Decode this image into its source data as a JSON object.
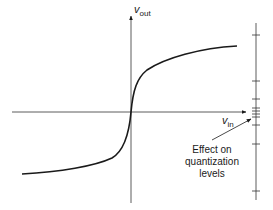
{
  "diagram": {
    "y_axis": {
      "symbol": "v",
      "subscript": "out"
    },
    "x_axis": {
      "symbol": "v",
      "subscript": "in"
    },
    "annotation": {
      "lines": [
        "Effect on",
        "quantization",
        "levels"
      ]
    },
    "curve": {
      "type": "compressor (odd-symmetric, steep slope near origin, saturating)",
      "path": "M22,174 C60,172 95,166 112,158 C124,151 129,135 131,112 C133,90 137,78 147,70 C165,58 200,48 237,46"
    },
    "quantization_scale": {
      "x": 256,
      "y_top": 23,
      "y_bottom": 200,
      "tick_y": [
        35,
        81,
        99,
        108,
        111,
        114,
        117,
        125,
        144,
        191
      ]
    },
    "colors": {
      "line": "#1a1a1a",
      "axis": "#333333",
      "background": "#ffffff"
    }
  }
}
